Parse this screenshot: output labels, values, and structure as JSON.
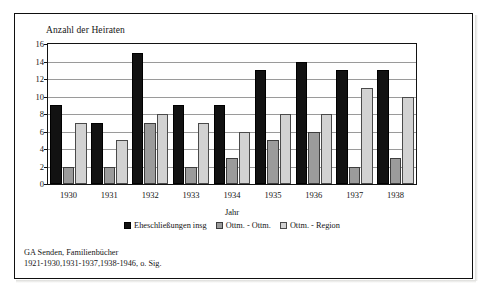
{
  "figure": {
    "axis_title_y": "Anzahl der Heiraten",
    "axis_title_x": "Jahr",
    "footnote_line1": "GA Senden, Familienbücher",
    "footnote_line2": "1921-1930,1931-1937,1938-1946, o. Sig."
  },
  "colors": {
    "series0": "#121212",
    "series1": "#9b9b9b",
    "series2": "#d2d2d2",
    "grid": "#9a9a9a",
    "frame": "#131313",
    "text": "#141414"
  },
  "chart_data": {
    "type": "bar",
    "title": "Anzahl der Heiraten",
    "xlabel": "Jahr",
    "ylabel": "Anzahl der Heiraten",
    "ylim": [
      0,
      16
    ],
    "yticks": [
      0,
      2,
      4,
      6,
      8,
      10,
      12,
      14,
      16
    ],
    "grid": true,
    "legend_position": "bottom",
    "categories": [
      "1930",
      "1931",
      "1932",
      "1933",
      "1934",
      "1935",
      "1936",
      "1937",
      "1938"
    ],
    "series": [
      {
        "name": "Eheschließungen insg",
        "color": "#121212",
        "values": [
          9,
          7,
          15,
          9,
          9,
          13,
          14,
          13,
          13
        ]
      },
      {
        "name": "Ottm. - Ottm.",
        "color": "#9b9b9b",
        "values": [
          2,
          2,
          7,
          2,
          3,
          5,
          6,
          2,
          3
        ]
      },
      {
        "name": "Ottm. - Region",
        "color": "#d2d2d2",
        "values": [
          7,
          5,
          8,
          7,
          6,
          8,
          8,
          11,
          10
        ]
      }
    ]
  }
}
